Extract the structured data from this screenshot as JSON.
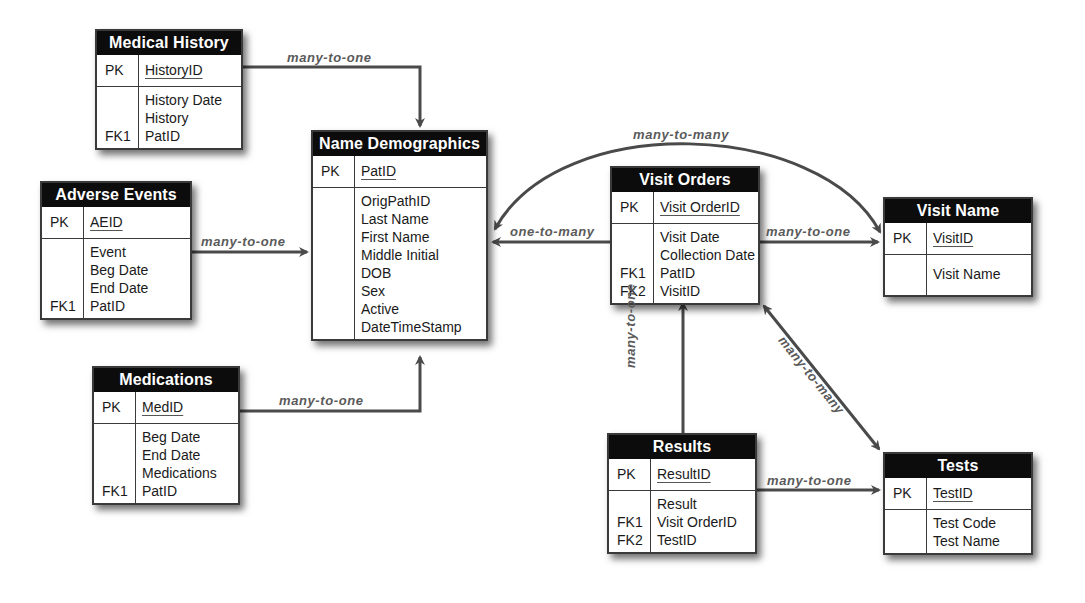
{
  "diagram": {
    "type": "entity-relationship",
    "colors": {
      "header_bg": "#0c0c0c",
      "header_text": "#ffffff",
      "border": "#3a3a3a",
      "connector": "#4a4a4a",
      "label": "#5a5a5a"
    },
    "entities": {
      "medical_history": {
        "title": "Medical History",
        "pk_key": "PK",
        "pk_field": "HistoryID",
        "attr_keys": [
          "",
          "",
          "FK1"
        ],
        "attrs": [
          "History Date",
          "History",
          "PatID"
        ]
      },
      "adverse_events": {
        "title": "Adverse Events",
        "pk_key": "PK",
        "pk_field": "AEID",
        "attr_keys": [
          "",
          "",
          "",
          "FK1"
        ],
        "attrs": [
          "Event",
          "Beg Date",
          "End Date",
          "PatID"
        ]
      },
      "name_demographics": {
        "title": "Name Demographics",
        "pk_key": "PK",
        "pk_field": "PatID",
        "attr_keys": [
          "",
          "",
          "",
          "",
          "",
          "",
          "",
          ""
        ],
        "attrs": [
          "OrigPathID",
          "Last Name",
          "First Name",
          "Middle Initial",
          "DOB",
          "Sex",
          "Active",
          "DateTimeStamp"
        ]
      },
      "medications": {
        "title": "Medications",
        "pk_key": "PK",
        "pk_field": "MedID",
        "attr_keys": [
          "",
          "",
          "",
          "FK1"
        ],
        "attrs": [
          "Beg Date",
          "End Date",
          "Medications",
          "PatID"
        ]
      },
      "visit_orders": {
        "title": "Visit Orders",
        "pk_key": "PK",
        "pk_field": "Visit OrderID",
        "attr_keys": [
          "",
          "",
          "FK1",
          "FK2"
        ],
        "attrs": [
          "Visit Date",
          "Collection Date",
          "PatID",
          "VisitID"
        ]
      },
      "visit_name": {
        "title": "Visit Name",
        "pk_key": "PK",
        "pk_field": "VisitID",
        "attr_keys": [
          ""
        ],
        "attrs": [
          "Visit Name"
        ]
      },
      "results": {
        "title": "Results",
        "pk_key": "PK",
        "pk_field": "ResultID",
        "attr_keys": [
          "",
          "FK1",
          "FK2"
        ],
        "attrs": [
          "Result",
          "Visit OrderID",
          "TestID"
        ]
      },
      "tests": {
        "title": "Tests",
        "pk_key": "PK",
        "pk_field": "TestID",
        "attr_keys": [
          "",
          ""
        ],
        "attrs": [
          "Test Code",
          "Test Name"
        ]
      }
    },
    "relationships": [
      {
        "from": "Medical History",
        "to": "Name Demographics",
        "label": "many-to-one"
      },
      {
        "from": "Adverse Events",
        "to": "Name Demographics",
        "label": "many-to-one"
      },
      {
        "from": "Medications",
        "to": "Name Demographics",
        "label": "many-to-one"
      },
      {
        "from": "Visit Orders",
        "to": "Name Demographics",
        "label": "one-to-many"
      },
      {
        "from": "Visit Name",
        "to": "Name Demographics",
        "label": "many-to-many"
      },
      {
        "from": "Visit Orders",
        "to": "Visit Name",
        "label": "many-to-one"
      },
      {
        "from": "Results",
        "to": "Visit Orders",
        "label": "many-to-one"
      },
      {
        "from": "Visit Orders",
        "to": "Tests",
        "label": "many-to-many"
      },
      {
        "from": "Results",
        "to": "Tests",
        "label": "many-to-one"
      }
    ]
  }
}
